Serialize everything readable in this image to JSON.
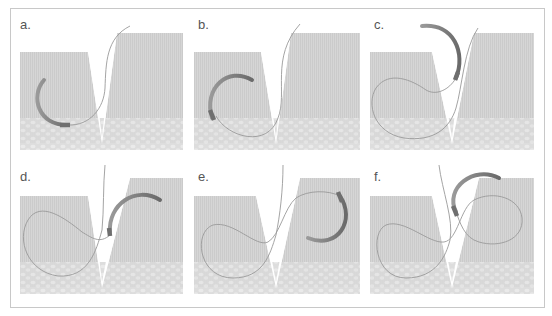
{
  "figure": {
    "colors": {
      "frame_border": "#c8c8c8",
      "tissue_dermis": "#d3d3d3",
      "tissue_subcutis": "#dcdcdc",
      "needle": "#8a8a8a",
      "needle_tip": "#6f6f6f",
      "thread": "#9a9a9a",
      "label": "#555555"
    },
    "panels": [
      {
        "id": "a",
        "label": "a.",
        "step": "Needle enters left wound edge"
      },
      {
        "id": "b",
        "label": "b.",
        "step": "Needle passes through left side tissue"
      },
      {
        "id": "c",
        "label": "c.",
        "step": "Needle exits into wound gap"
      },
      {
        "id": "d",
        "label": "d.",
        "step": "Needle enters right wound edge"
      },
      {
        "id": "e",
        "label": "e.",
        "step": "Needle passes through right side tissue"
      },
      {
        "id": "f",
        "label": "f.",
        "step": "Needle exits right side, thread forms loop"
      }
    ]
  }
}
